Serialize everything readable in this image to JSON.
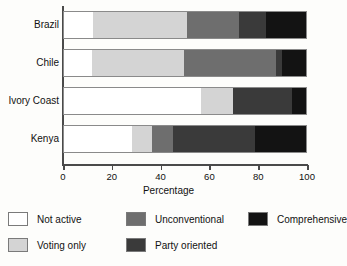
{
  "chart_data": {
    "type": "bar",
    "orientation": "horizontal",
    "stacked": true,
    "title": "",
    "xlabel": "Percentage",
    "ylabel": "",
    "xlim": [
      0,
      100
    ],
    "xticks": [
      0,
      20,
      40,
      60,
      80,
      100
    ],
    "grid": false,
    "legend_position": "bottom",
    "categories": [
      "Brazil",
      "Chile",
      "Ivory Coast",
      "Kenya"
    ],
    "series": [
      {
        "name": "Not active",
        "color": "#ffffff",
        "values": [
          12,
          11.5,
          56.5,
          28
        ]
      },
      {
        "name": "Voting only",
        "color": "#d4d4d4",
        "values": [
          39,
          38,
          13.5,
          8.5
        ]
      },
      {
        "name": "Unconventional",
        "color": "#6e6e6e",
        "values": [
          21.5,
          38,
          0,
          8.5
        ]
      },
      {
        "name": "Party oriented",
        "color": "#3a3a3a",
        "values": [
          11,
          2.5,
          24,
          34
        ]
      },
      {
        "name": "Comprehensive",
        "color": "#131313",
        "values": [
          16.5,
          10,
          6,
          21
        ]
      }
    ]
  },
  "axis": {
    "tick_labels": [
      "0",
      "20",
      "40",
      "60",
      "80",
      "100"
    ],
    "x_title": "Percentage"
  },
  "legend": {
    "rows": [
      [
        {
          "label": "Not active",
          "color": "#ffffff"
        },
        {
          "label": "Unconventional",
          "color": "#6e6e6e"
        },
        {
          "label": "Comprehensive",
          "color": "#131313"
        }
      ],
      [
        {
          "label": "Voting only",
          "color": "#d4d4d4"
        },
        {
          "label": "Party oriented",
          "color": "#3a3a3a"
        }
      ]
    ]
  }
}
